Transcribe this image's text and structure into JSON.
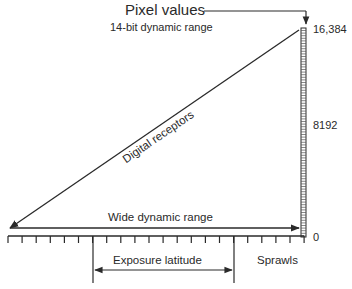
{
  "diagram": {
    "title": "Pixel values",
    "subtitle": "14-bit dynamic range",
    "y_scale": {
      "ticks": [
        {
          "label": "16,384",
          "value": 16384
        },
        {
          "label": "8192",
          "value": 8192
        },
        {
          "label": "0",
          "value": 0
        }
      ]
    },
    "diagonal_label": "Digital receptors",
    "wide_range_label": "Wide dynamic range",
    "latitude_label": "Exposure latitude",
    "credit": "Sprawls",
    "colors": {
      "line": "#2a2a2a",
      "background": "#ffffff"
    }
  }
}
